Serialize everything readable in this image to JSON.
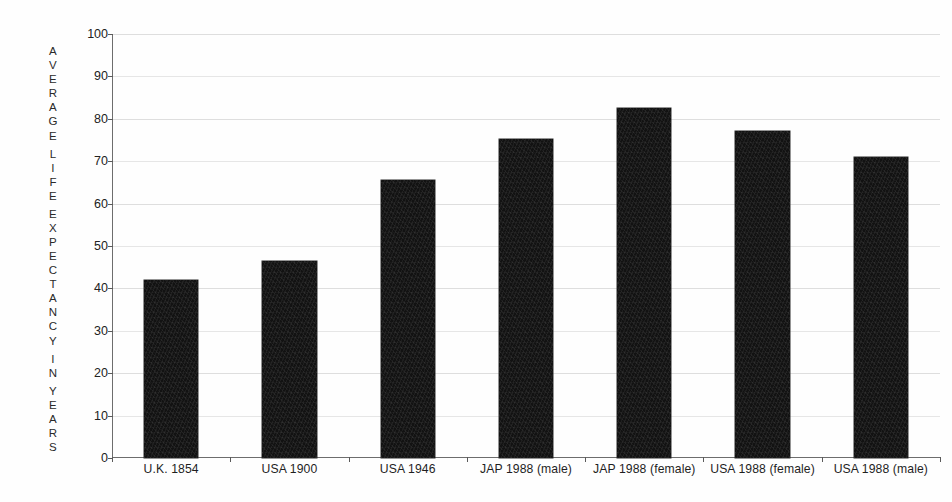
{
  "chart_data": {
    "type": "bar",
    "title": "",
    "subtitle": "",
    "xlabel": "",
    "ylabel": "AVERAGE LIFE EXPECTANCY IN YEARS",
    "ylabel_stacked_lines": [
      "A",
      "V",
      "E",
      "R",
      "A",
      "G",
      "E",
      "",
      "L",
      "I",
      "F",
      "E",
      "",
      "E",
      "X",
      "P",
      "E",
      "C",
      "T",
      "A",
      "N",
      "C",
      "Y",
      "",
      "I",
      "N",
      "",
      "Y",
      "E",
      "A",
      "R",
      "S"
    ],
    "categories": [
      "U.K.  1854",
      "USA  1900",
      "USA  1946",
      "JAP  1988 (male)",
      "JAP  1988 (female)",
      "USA  1988 (female)",
      "USA  1988 (male)"
    ],
    "values": [
      42,
      46.5,
      65.5,
      75.3,
      82.5,
      77.2,
      71
    ],
    "ylim": [
      0,
      100
    ],
    "ytick_labels": [
      "100",
      "90",
      "80",
      "70",
      "60",
      "50",
      "40",
      "30",
      "20",
      "10",
      "0"
    ],
    "ytick_values": [
      100,
      90,
      80,
      70,
      60,
      50,
      40,
      30,
      20,
      10,
      0
    ],
    "grid": true,
    "grid_axis": "y",
    "legend": "none",
    "bar_color": "#121212",
    "axis_color": "#6d6d6d",
    "grid_color": "#d8d8d8",
    "background_color": "#fefefe",
    "annotations": []
  }
}
